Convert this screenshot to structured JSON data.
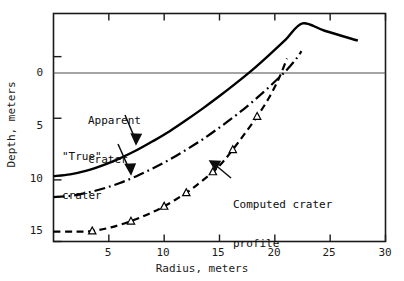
{
  "figure": {
    "background": "#ffffff",
    "ink_color": "#000000",
    "axis_color": "#1a1a1a"
  },
  "axes": {
    "x_title": "Radius, meters",
    "y_title": "Depth, meters",
    "x_ticks": [
      "5",
      "10",
      "15",
      "20",
      "25",
      "30"
    ],
    "y_ticks": [
      "0",
      "5",
      "10",
      "15"
    ]
  },
  "annotations": [
    {
      "id": "apparent",
      "line1": "Apparent",
      "line2": "crater"
    },
    {
      "id": "true",
      "line1": "\"True\"",
      "line2": "crater"
    },
    {
      "id": "computed",
      "line1": "Computed crater",
      "line2": "profile"
    }
  ],
  "chart_data": {
    "type": "line",
    "title": "",
    "xlabel": "Radius, meters",
    "ylabel": "Depth, meters",
    "xlim": [
      0,
      30
    ],
    "ylim": [
      -3.5,
      15
    ],
    "y_inverted": true,
    "grid": false,
    "legend": "none",
    "zero_line": 0,
    "xticks": [
      5,
      10,
      15,
      20,
      25,
      30
    ],
    "yticks": [
      0,
      5,
      10,
      15
    ],
    "series": [
      {
        "name": "Apparent crater",
        "style": "solid",
        "marker": "none",
        "points": [
          [
            0.0,
            9.7
          ],
          [
            1.5,
            9.55
          ],
          [
            3.0,
            9.25
          ],
          [
            4.5,
            8.8
          ],
          [
            6.0,
            8.25
          ],
          [
            7.5,
            7.6
          ],
          [
            9.0,
            6.85
          ],
          [
            10.5,
            6.05
          ],
          [
            12.0,
            5.15
          ],
          [
            13.5,
            4.2
          ],
          [
            15.0,
            3.2
          ],
          [
            16.5,
            2.15
          ],
          [
            18.0,
            1.05
          ],
          [
            19.5,
            -0.15
          ],
          [
            21.0,
            -1.4
          ],
          [
            22.5,
            -2.7
          ],
          [
            24.5,
            -2.1
          ],
          [
            27.5,
            -1.3
          ]
        ]
      },
      {
        "name": "\"True\" crater",
        "style": "dashdot",
        "marker": "none",
        "points": [
          [
            0.0,
            11.4
          ],
          [
            1.5,
            11.3
          ],
          [
            3.0,
            11.05
          ],
          [
            4.5,
            10.7
          ],
          [
            6.0,
            10.25
          ],
          [
            7.5,
            9.7
          ],
          [
            9.0,
            9.05
          ],
          [
            10.5,
            8.35
          ],
          [
            12.0,
            7.55
          ],
          [
            13.5,
            6.7
          ],
          [
            15.0,
            5.75
          ],
          [
            16.5,
            4.75
          ],
          [
            18.0,
            3.65
          ],
          [
            19.5,
            2.45
          ],
          [
            21.0,
            1.15
          ],
          [
            22.0,
            0.1
          ],
          [
            22.4,
            -0.45
          ]
        ]
      },
      {
        "name": "Computed crater profile",
        "style": "dashed",
        "marker": "triangle",
        "points": [
          [
            0.0,
            14.2
          ],
          [
            1.8,
            14.2
          ],
          [
            3.5,
            14.15
          ],
          [
            5.2,
            13.85
          ],
          [
            7.0,
            13.35
          ],
          [
            8.5,
            12.8
          ],
          [
            10.0,
            12.15
          ],
          [
            12.0,
            11.05
          ],
          [
            13.2,
            10.25
          ],
          [
            14.4,
            9.35
          ],
          [
            15.3,
            8.55
          ],
          [
            16.2,
            7.55
          ],
          [
            17.2,
            6.35
          ],
          [
            18.4,
            4.85
          ],
          [
            19.5,
            3.3
          ],
          [
            20.4,
            1.7
          ],
          [
            21.1,
            0.15
          ]
        ],
        "marker_points": [
          [
            3.5,
            14.15
          ],
          [
            7.0,
            13.35
          ],
          [
            10.0,
            12.15
          ],
          [
            12.0,
            11.05
          ],
          [
            14.4,
            9.35
          ],
          [
            16.2,
            7.55
          ],
          [
            18.4,
            4.85
          ]
        ]
      }
    ]
  }
}
